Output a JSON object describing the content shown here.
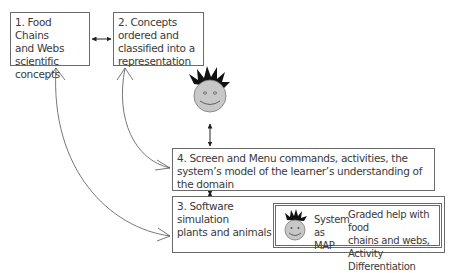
{
  "diagram": {
    "nodes": {
      "food_chains": {
        "label": "1. Food Chains\nand Webs\nscientific\nconcepts"
      },
      "concepts_ordered": {
        "label": "2. Concepts\nordered and\nclassified into a\nrepresentation"
      },
      "screen_menu": {
        "label": "4. Screen and Menu commands, activities, the\nsystem’s model of the learner’s understanding of\nthe domain"
      },
      "software_sim": {
        "label": "3. Software\nsimulation\nplants and animals"
      },
      "system_map": {
        "label": "System\nas MAP",
        "description": "Graded help with food\nchains and webs, Activity\nDifferentiation"
      }
    },
    "icons": {
      "learner": "smiley-face-icon",
      "system": "smiley-face-icon"
    },
    "edges": [
      {
        "from": "food_chains",
        "to": "concepts_ordered",
        "type": "bidirectional"
      },
      {
        "from": "learner",
        "to": "screen_menu",
        "type": "bidirectional"
      },
      {
        "from": "screen_menu",
        "to": "software_sim",
        "type": "bidirectional"
      },
      {
        "from": "concepts_ordered",
        "to": "screen_menu",
        "type": "curved-bidirectional"
      },
      {
        "from": "food_chains",
        "to": "software_sim",
        "type": "curved-bidirectional"
      }
    ],
    "colors": {
      "stroke": "#6a6a6a",
      "face_fill": "#c8c8c8",
      "hair": "#111111",
      "text": "#3a3a3a"
    }
  }
}
